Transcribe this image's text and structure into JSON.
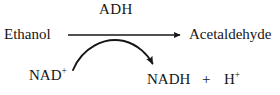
{
  "diagram": {
    "type": "biochemical-reaction",
    "background_color": "#ffffff",
    "stroke_color": "#161616",
    "enzyme": {
      "name": "enzyme-label",
      "text": "ADH"
    },
    "substrate": {
      "name": "substrate-label",
      "text": "Ethanol"
    },
    "product": {
      "name": "product-label",
      "text": "Acetaldehyde"
    },
    "cofactor_in": {
      "name": "cofactor-in-label",
      "base": "NAD",
      "charge": "+"
    },
    "cofactor_out": {
      "name": "cofactor-out-label",
      "base": "NADH"
    },
    "plus": {
      "name": "plus-sign-label",
      "text": "+"
    },
    "proton": {
      "name": "proton-label",
      "base": "H",
      "charge": "+"
    },
    "main_arrow": {
      "name": "main-reaction-arrow",
      "direction": "left-to-right",
      "style": "straight-solid",
      "x_start": 68,
      "x_end": 185,
      "y": 35
    },
    "curved_arrow": {
      "name": "cofactor-curved-arrow",
      "direction": "left-to-right-arc",
      "style": "curved-solid",
      "x_start": 73,
      "y_start": 70,
      "x_end": 156,
      "y_end": 68,
      "apex_y": 37
    }
  }
}
